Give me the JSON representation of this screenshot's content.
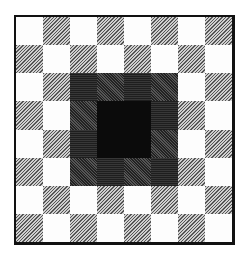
{
  "figure": {
    "rows": 8,
    "cols": 8,
    "pattern_rule": "cell with (row+col) odd is hatched, even is white",
    "center_region": {
      "rows": [
        2,
        5
      ],
      "cols": [
        2,
        5
      ],
      "ring_shades": {
        "even": "medium-gray",
        "odd": "dark-gray"
      },
      "core": {
        "rows": [
          3,
          4
        ],
        "cols": [
          3,
          4
        ],
        "shade": "black"
      }
    },
    "colors": {
      "white": "#fdfdfd",
      "hatch": "#8f8f8f",
      "ring_medium": "#5e5e5e",
      "ring_dark": "#3a3a3a",
      "core": "#0b0b0b",
      "border": "#111111"
    }
  }
}
